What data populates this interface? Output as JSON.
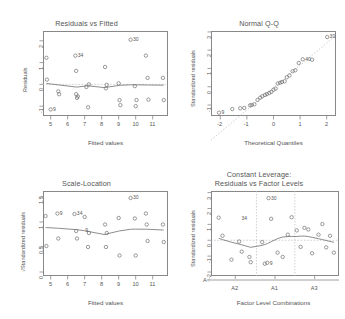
{
  "figure": {
    "kind": "r-lm-diagnostic-2x2",
    "background": "#ffffff",
    "point_color": "#707070",
    "line_color": "#6f6f6f",
    "ref_line_color": "#bdbdbd"
  },
  "chart_data": [
    {
      "type": "scatter",
      "id": "residuals-vs-fitted",
      "title": "Residuals vs Fitted",
      "xlabel": "Fitted values",
      "ylabel": "Residuals",
      "xlim": [
        4.55,
        11.9
      ],
      "ylim": [
        -1.45,
        2.45
      ],
      "xticks": [
        5,
        6,
        7,
        8,
        9,
        10,
        11
      ],
      "yticks": [
        -1,
        0,
        1,
        2
      ],
      "grid": false,
      "zero_line": true,
      "x": [
        4.75,
        4.78,
        5.0,
        5.45,
        5.5,
        6.45,
        6.5,
        6.5,
        6.55,
        6.6,
        7.1,
        7.2,
        7.25,
        8.2,
        8.25,
        8.3,
        9.0,
        9.05,
        9.1,
        9.7,
        9.95,
        10.0,
        10.05,
        10.6,
        10.7,
        10.75,
        11.6,
        11.65
      ],
      "y": [
        1.22,
        0.22,
        -1.15,
        -0.32,
        -0.45,
        1.32,
        0.62,
        -0.45,
        -0.62,
        -0.55,
        -0.12,
        -1.05,
        0.0,
        0.8,
        -0.18,
        -0.02,
        0.05,
        -0.72,
        -0.95,
        2.05,
        -0.08,
        -1.0,
        -0.72,
        1.32,
        0.3,
        -0.7,
        0.3,
        -0.72
      ],
      "labels": [
        {
          "text": "30",
          "x": 9.7,
          "y": 2.05
        },
        {
          "text": "34",
          "x": 6.45,
          "y": 1.32
        },
        {
          "text": "9",
          "x": 5.0,
          "y": -1.15
        }
      ],
      "smoother": "lowess"
    },
    {
      "type": "scatter",
      "id": "normal-qq",
      "title": "Normal Q-Q",
      "xlabel": "Theoretical Quantiles",
      "ylabel": "Standardized residuals",
      "xlim": [
        -2.35,
        2.35
      ],
      "ylim": [
        -1.6,
        3.05
      ],
      "xticks": [
        -2,
        -1,
        0,
        1,
        2
      ],
      "yticks": [
        -1,
        0,
        1,
        2,
        3
      ],
      "grid": false,
      "reference_line": true,
      "x": [
        -2.05,
        -1.55,
        -1.25,
        -1.1,
        -0.88,
        -0.82,
        -0.72,
        -0.6,
        -0.5,
        -0.42,
        -0.32,
        -0.25,
        -0.16,
        -0.08,
        0.0,
        0.08,
        0.16,
        0.25,
        0.32,
        0.42,
        0.5,
        0.6,
        0.72,
        0.82,
        0.95,
        1.1,
        1.45,
        2.02
      ],
      "y": [
        -1.42,
        -1.22,
        -1.18,
        -1.16,
        -1.02,
        -1.0,
        -0.96,
        -0.72,
        -0.6,
        -0.52,
        -0.45,
        -0.4,
        -0.34,
        -0.28,
        -0.16,
        -0.1,
        0.18,
        0.22,
        0.26,
        0.3,
        0.52,
        0.62,
        0.85,
        0.9,
        1.3,
        1.5,
        1.48,
        2.72
      ],
      "labels": [
        {
          "text": "30",
          "x": 2.02,
          "y": 2.72
        },
        {
          "text": "40",
          "x": 1.1,
          "y": 1.5
        },
        {
          "text": "9",
          "x": -2.05,
          "y": -1.42
        }
      ]
    },
    {
      "type": "scatter",
      "id": "scale-location",
      "title": "Scale-Location",
      "xlabel": "Fitted values",
      "ylabel": "√Standardized residuals",
      "xlim": [
        4.55,
        11.9
      ],
      "ylim": [
        -0.08,
        1.62
      ],
      "xticks": [
        5,
        6,
        7,
        8,
        9,
        10,
        11
      ],
      "yticks": [
        0.0,
        0.5,
        1.0,
        1.5
      ],
      "grid": false,
      "x": [
        4.7,
        4.75,
        5.4,
        5.45,
        6.4,
        6.5,
        6.55,
        7.0,
        7.2,
        7.25,
        8.2,
        8.25,
        8.3,
        9.0,
        9.05,
        9.7,
        9.95,
        10.0,
        10.6,
        10.65,
        10.7,
        11.6,
        11.65
      ],
      "y": [
        1.12,
        0.52,
        1.17,
        0.67,
        1.16,
        0.82,
        0.67,
        1.1,
        0.5,
        0.78,
        0.95,
        0.5,
        0.78,
        1.08,
        0.33,
        1.48,
        1.07,
        0.33,
        1.17,
        0.95,
        0.62,
        0.95,
        0.6
      ],
      "labels": [
        {
          "text": "30",
          "x": 9.7,
          "y": 1.48
        },
        {
          "text": "34",
          "x": 6.4,
          "y": 1.16
        },
        {
          "text": "9",
          "x": 5.4,
          "y": 1.17
        },
        {
          "text": "9",
          "x": 6.9,
          "y": 0.82
        }
      ],
      "smoother": "lowess"
    },
    {
      "type": "scatter",
      "id": "residuals-vs-factor-levels",
      "title": "Constant Leverage:",
      "subtitle": "Residuals vs Factor Levels",
      "xlabel": "Factor Level Combinations",
      "ylabel": "Standardized residuals",
      "group_axis_label": "A :",
      "group_labels": [
        "A2",
        "A1",
        "A3"
      ],
      "ylim": [
        -2.25,
        3.1
      ],
      "yticks": [
        -2,
        -1,
        0,
        1,
        2,
        3
      ],
      "grid": false,
      "zero_line": true,
      "group_dividers": [
        0.355,
        0.655
      ],
      "x": [
        0.06,
        0.09,
        0.16,
        0.22,
        0.24,
        0.3,
        0.31,
        0.4,
        0.42,
        0.44,
        0.45,
        0.47,
        0.52,
        0.56,
        0.6,
        0.63,
        0.67,
        0.7,
        0.73,
        0.76,
        0.79,
        0.84,
        0.87,
        0.9,
        0.93,
        0.96
      ],
      "y": [
        1.42,
        0.28,
        -1.22,
        -0.08,
        -0.72,
        -1.05,
        -1.38,
        -0.12,
        -1.48,
        -1.42,
        2.65,
        1.35,
        -0.78,
        -1.05,
        0.35,
        1.45,
        0.62,
        -0.42,
        0.78,
        0.68,
        -0.82,
        0.35,
        1.02,
        -0.45,
        0.28,
        -0.78
      ],
      "labels": [
        {
          "text": "30",
          "x": 0.45,
          "y": 2.65
        },
        {
          "text": "34",
          "x": 0.22,
          "y": 1.35
        },
        {
          "text": "9",
          "x": 0.44,
          "y": -1.48
        }
      ],
      "smoother": "lowess"
    }
  ]
}
